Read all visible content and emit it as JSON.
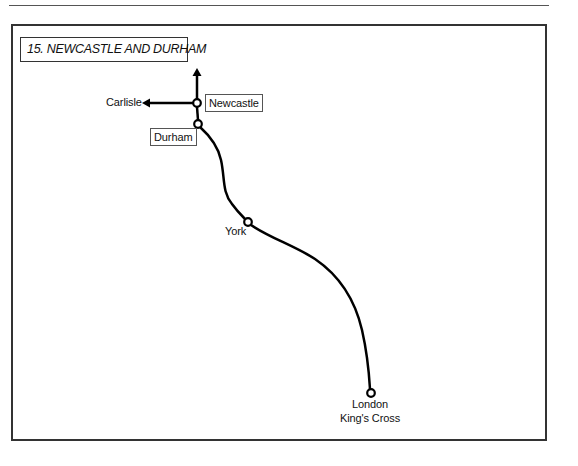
{
  "title": "15. NEWCASTLE AND DURHAM",
  "colors": {
    "line": "#000000",
    "frame": "#333333",
    "background": "#ffffff"
  },
  "stations": [
    {
      "name": "Newcastle",
      "boxed": true,
      "x": 197,
      "y": 103
    },
    {
      "name": "Durham",
      "boxed": true,
      "x": 198,
      "y": 124
    },
    {
      "name": "York",
      "boxed": false,
      "x": 248,
      "y": 222
    },
    {
      "name": "London",
      "name_line2": "King's Cross",
      "boxed": false,
      "x": 371,
      "y": 393
    }
  ],
  "directions": [
    {
      "name": "Carlisle",
      "arrow": "left"
    },
    {
      "name": "",
      "arrow": "up"
    }
  ]
}
